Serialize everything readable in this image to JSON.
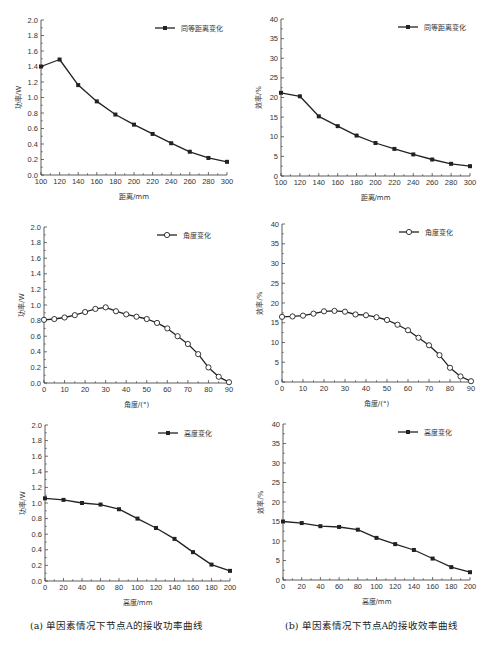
{
  "captions": {
    "a": "(a) 单因素情况下节点A的接收功率曲线",
    "b": "(b) 单因素情况下节点A的接收效率曲线"
  },
  "chart_data": [
    {
      "id": "power-distance",
      "type": "line",
      "title": "",
      "xlabel": "距离/mm",
      "ylabel": "功率/W",
      "legend": "同等距离变化",
      "marker": "square",
      "x": [
        100,
        120,
        140,
        160,
        180,
        200,
        220,
        240,
        260,
        280,
        300
      ],
      "values": [
        1.4,
        1.49,
        1.16,
        0.95,
        0.78,
        0.65,
        0.53,
        0.41,
        0.3,
        0.22,
        0.17
      ],
      "xlim": [
        100,
        300
      ],
      "ylim": [
        0,
        2.0
      ],
      "xticks": [
        100,
        120,
        140,
        160,
        180,
        200,
        220,
        240,
        260,
        280,
        300
      ],
      "yticks": [
        "0.0",
        "0.2",
        "0.4",
        "0.6",
        "0.8",
        "1.0",
        "1.2",
        "1.4",
        "1.6",
        "1.8",
        "2.0"
      ],
      "grid": false,
      "legend_position": "upper right",
      "box": {
        "x0": 41,
        "x1": 227,
        "y0": 175,
        "y1": 20
      }
    },
    {
      "id": "efficiency-distance",
      "type": "line",
      "title": "",
      "xlabel": "距离/mm",
      "ylabel": "效率/%",
      "legend": "同等距离变化",
      "marker": "square",
      "x": [
        100,
        120,
        140,
        160,
        180,
        200,
        220,
        240,
        260,
        280,
        300
      ],
      "values": [
        21.2,
        20.3,
        15.2,
        12.7,
        10.3,
        8.4,
        6.9,
        5.5,
        4.2,
        3.1,
        2.5
      ],
      "xlim": [
        100,
        300
      ],
      "ylim": [
        0,
        40
      ],
      "xticks": [
        100,
        120,
        140,
        160,
        180,
        200,
        220,
        240,
        260,
        280,
        300
      ],
      "yticks": [
        "0",
        "5",
        "10",
        "15",
        "20",
        "25",
        "30",
        "35",
        "40"
      ],
      "grid": false,
      "legend_position": "upper right",
      "box": {
        "x0": 281,
        "x1": 470,
        "y0": 176,
        "y1": 19
      }
    },
    {
      "id": "power-angle",
      "type": "line",
      "title": "",
      "xlabel": "角度/(°)",
      "ylabel": "功率/W",
      "legend": "角度变化",
      "marker": "open-circle",
      "x": [
        0,
        5,
        10,
        15,
        20,
        25,
        30,
        35,
        40,
        45,
        50,
        55,
        60,
        65,
        70,
        75,
        80,
        85,
        90
      ],
      "values": [
        0.81,
        0.82,
        0.84,
        0.87,
        0.91,
        0.95,
        0.97,
        0.92,
        0.88,
        0.85,
        0.82,
        0.77,
        0.7,
        0.6,
        0.5,
        0.37,
        0.2,
        0.08,
        0.01
      ],
      "xlim": [
        0,
        90
      ],
      "ylim": [
        0,
        2.0
      ],
      "xticks": [
        0,
        10,
        20,
        30,
        40,
        50,
        60,
        70,
        80,
        90
      ],
      "yticks": [
        "0.0",
        "0.2",
        "0.4",
        "0.6",
        "0.8",
        "1.0",
        "1.2",
        "1.4",
        "1.6",
        "1.8",
        "2.0"
      ],
      "grid": false,
      "legend_position": "upper right",
      "box": {
        "x0": 44,
        "x1": 229,
        "y0": 383,
        "y1": 227
      }
    },
    {
      "id": "efficiency-angle",
      "type": "line",
      "title": "",
      "xlabel": "角度/(°)",
      "ylabel": "效率/%",
      "legend": "角度变化",
      "marker": "open-circle",
      "x": [
        0,
        5,
        10,
        15,
        20,
        25,
        30,
        35,
        40,
        45,
        50,
        55,
        60,
        65,
        70,
        75,
        80,
        85,
        90
      ],
      "values": [
        16.5,
        16.6,
        16.8,
        17.3,
        17.9,
        18.0,
        17.8,
        17.1,
        16.9,
        16.4,
        15.7,
        14.5,
        13.1,
        11.2,
        9.3,
        6.8,
        3.6,
        1.4,
        0.2
      ],
      "xlim": [
        0,
        90
      ],
      "ylim": [
        0,
        40
      ],
      "xticks": [
        0,
        10,
        20,
        30,
        40,
        50,
        60,
        70,
        80,
        90
      ],
      "yticks": [
        "0",
        "5",
        "10",
        "15",
        "20",
        "25",
        "30",
        "35",
        "40"
      ],
      "grid": false,
      "legend_position": "upper right",
      "box": {
        "x0": 282,
        "x1": 471,
        "y0": 382,
        "y1": 224
      }
    },
    {
      "id": "power-height",
      "type": "line",
      "title": "",
      "xlabel": "高度/mm",
      "ylabel": "功率/W",
      "legend": "高度变化",
      "marker": "square",
      "x": [
        0,
        20,
        40,
        60,
        80,
        100,
        120,
        140,
        160,
        180,
        200
      ],
      "values": [
        1.06,
        1.04,
        1.0,
        0.98,
        0.92,
        0.8,
        0.68,
        0.54,
        0.37,
        0.21,
        0.13
      ],
      "xlim": [
        0,
        200
      ],
      "ylim": [
        0,
        2.0
      ],
      "xticks": [
        0,
        20,
        40,
        60,
        80,
        100,
        120,
        140,
        160,
        180,
        200
      ],
      "yticks": [
        "0.0",
        "0.2",
        "0.4",
        "0.6",
        "0.8",
        "1.0",
        "1.2",
        "1.4",
        "1.6",
        "1.8",
        "2.0"
      ],
      "grid": false,
      "legend_position": "upper right",
      "box": {
        "x0": 45,
        "x1": 230,
        "y0": 581,
        "y1": 425
      }
    },
    {
      "id": "efficiency-height",
      "type": "line",
      "title": "",
      "xlabel": "高度/mm",
      "ylabel": "效率/%",
      "legend": "高度变化",
      "marker": "square",
      "x": [
        0,
        20,
        40,
        60,
        80,
        100,
        120,
        140,
        160,
        180,
        200
      ],
      "values": [
        15.0,
        14.6,
        13.8,
        13.6,
        12.9,
        10.8,
        9.2,
        7.7,
        5.5,
        3.3,
        2.0
      ],
      "xlim": [
        0,
        200
      ],
      "ylim": [
        0,
        40
      ],
      "xticks": [
        0,
        20,
        40,
        60,
        80,
        100,
        120,
        140,
        160,
        180,
        200
      ],
      "yticks": [
        "0",
        "5",
        "10",
        "15",
        "20",
        "25",
        "30",
        "35",
        "40"
      ],
      "grid": false,
      "legend_position": "upper right",
      "box": {
        "x0": 283,
        "x1": 470,
        "y0": 580,
        "y1": 424
      }
    }
  ]
}
